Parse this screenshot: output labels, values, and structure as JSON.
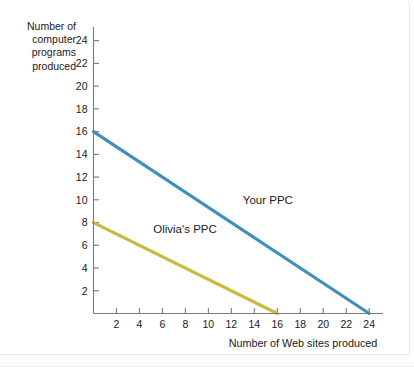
{
  "chart_data": {
    "type": "line",
    "title": "",
    "subtitle": "",
    "xlabel": "Number of Web sites produced",
    "ylabel": "Number of computer programs produced",
    "ylabel_lines": [
      "Number of",
      "computer",
      "programs",
      "produced"
    ],
    "xlim": [
      0,
      25.2
    ],
    "ylim": [
      0,
      25.2
    ],
    "xticks": [
      2,
      4,
      6,
      8,
      10,
      12,
      14,
      16,
      18,
      20,
      22,
      24
    ],
    "yticks": [
      2,
      4,
      6,
      8,
      10,
      12,
      14,
      16,
      18,
      20,
      22,
      24
    ],
    "xtick_labels": [
      "2",
      "4",
      "6",
      "8",
      "10",
      "12",
      "14",
      "16",
      "18",
      "20",
      "22",
      "24"
    ],
    "ytick_labels": [
      "2",
      "4",
      "6",
      "8",
      "10",
      "12",
      "14",
      "16",
      "18",
      "20",
      "22",
      "24"
    ],
    "grid": false,
    "legend": "inline-annotations",
    "series": [
      {
        "name": "Your PPC",
        "color": "#3f8fbd",
        "annotation": "Your PPC",
        "annotation_x": 13.0,
        "annotation_y": 9.6,
        "x": [
          0,
          24
        ],
        "y": [
          16,
          0
        ],
        "points": [
          [
            0,
            16
          ],
          [
            24,
            0
          ]
        ],
        "slope": -0.6667,
        "x_intercept": 24,
        "y_intercept": 16
      },
      {
        "name": "Olivia's PPC",
        "color": "#c9b93f",
        "annotation": "Olivia's PPC",
        "annotation_x": 5.2,
        "annotation_y": 7.1,
        "x": [
          0,
          16
        ],
        "y": [
          8,
          0
        ],
        "points": [
          [
            0,
            8
          ],
          [
            16,
            0
          ]
        ],
        "slope": -0.5,
        "x_intercept": 16,
        "y_intercept": 8
      }
    ]
  },
  "colors": {
    "your_ppc": "#3f8fbd",
    "olivias_ppc": "#c9b93f",
    "axis": "#7a7a7a",
    "text": "#1a1a1a",
    "background": "#ffffff"
  }
}
